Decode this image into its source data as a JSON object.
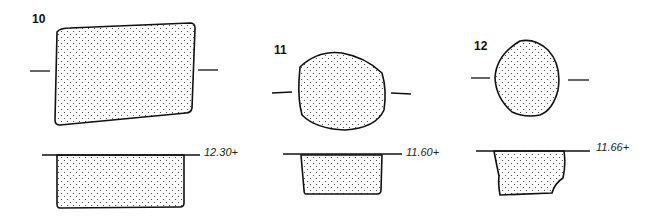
{
  "figures": [
    {
      "number": "10",
      "level_label": "12.30+"
    },
    {
      "number": "11",
      "level_label": "11.60+"
    },
    {
      "number": "12",
      "level_label": "11.66+"
    }
  ],
  "colors": {
    "ink": "#111111",
    "background": "#ffffff"
  }
}
